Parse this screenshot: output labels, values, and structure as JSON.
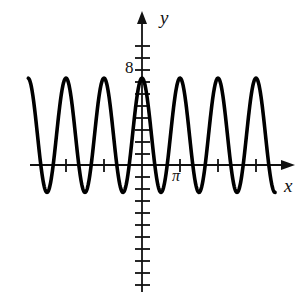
{
  "figure": {
    "title": "",
    "background_color": "#ffffff",
    "curve_color": "#000000",
    "axis_color": "#111111"
  },
  "labels": {
    "y_axis": "y",
    "x_axis": "x",
    "y_tick_8": "8",
    "x_tick_pi": "π"
  },
  "chart_data": {
    "type": "line",
    "title": "",
    "xlabel": "x",
    "ylabel": "y",
    "grid": false,
    "legend": null,
    "annotations": [
      "8",
      "π"
    ],
    "xlim": [
      -9.4,
      11.0
    ],
    "ylim": [
      -10.5,
      11.5
    ],
    "x_tick_labels": [
      "",
      "",
      "",
      "π",
      "",
      ""
    ],
    "x_tick_values": [
      -9.42,
      -6.28,
      -3.14,
      3.14,
      6.28,
      9.42
    ],
    "x_tick_spacing": 3.14159,
    "y_tick_labels": [
      "8"
    ],
    "y_tick_values": [
      8
    ],
    "y_tick_spacing": 1,
    "series": [
      {
        "name": "y = 8 cos(2x)",
        "function": "amplitude*cos(2*x) form, peaks near y=7.3, troughs near y=-2.3",
        "amplitude": 4.8,
        "midline": 2.5,
        "period": 3.14159,
        "peak_value": 7.3,
        "trough_value": -2.3,
        "num_visible_cycles": 6,
        "x": [
          -9.42,
          -8.64,
          -7.85,
          -7.07,
          -6.28,
          -5.5,
          -4.71,
          -3.93,
          -3.14,
          -2.36,
          -1.57,
          -0.79,
          0.0,
          0.79,
          1.57,
          2.36,
          3.14,
          3.93,
          4.71,
          5.5,
          6.28,
          7.07,
          7.85,
          8.64,
          9.42
        ],
        "values": [
          7.3,
          2.5,
          -2.3,
          2.5,
          7.3,
          2.5,
          -2.3,
          2.5,
          7.3,
          2.5,
          -2.3,
          2.5,
          7.3,
          2.5,
          -2.3,
          2.5,
          7.3,
          2.5,
          -2.3,
          2.5,
          7.3,
          2.5,
          -2.3,
          2.5,
          7.3
        ]
      }
    ]
  }
}
